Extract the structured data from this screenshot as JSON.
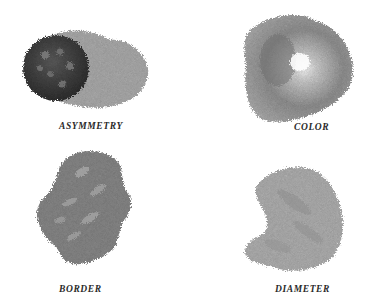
{
  "figure": {
    "panels": [
      {
        "id": "asymmetry",
        "label": "ASYMMETRY",
        "illustration": "asymmetric-lesion-with-dark-nodule"
      },
      {
        "id": "color",
        "label": "COLOR",
        "illustration": "lesion-with-varied-shading"
      },
      {
        "id": "border",
        "label": "BORDER",
        "illustration": "lesion-with-irregular-border"
      },
      {
        "id": "diameter",
        "label": "DIAMETER",
        "illustration": "large-diameter-lesion"
      }
    ],
    "colors": {
      "background": "#ffffff",
      "label_text": "#2a2a2a",
      "lesion_dark": "#3e3e3e",
      "lesion_mid": "#7d7d7d",
      "lesion_light": "#b8b8b8"
    }
  }
}
